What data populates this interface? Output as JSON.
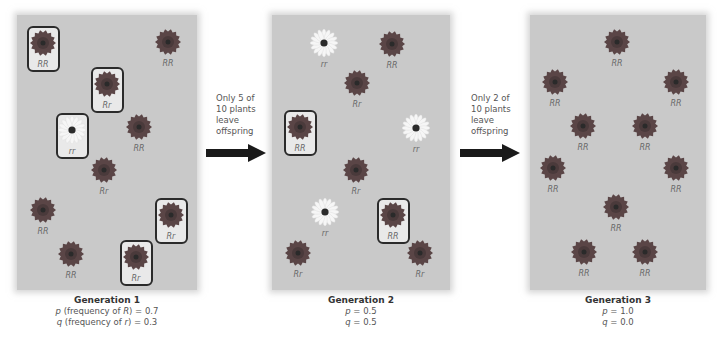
{
  "colors": {
    "panel_bg": "#c9c9c9",
    "dark_flower": "#5a4546",
    "white_flower": "#f6f6f6",
    "flower_center": "#2a2a2a",
    "box_border": "#2b2b2b",
    "arrow": "#1a1a1a"
  },
  "panels": [
    {
      "id": "generation-1",
      "left": 17,
      "width": 180,
      "caption": {
        "title": "Generation 1",
        "p_label": "p",
        "p_text": " (frequency of ",
        "p_allele": "R",
        "p_value": ") = 0.7",
        "q_label": "q",
        "q_text": " (frequency of ",
        "q_allele": "r",
        "q_value": ") = 0.3"
      },
      "plants": [
        {
          "x": 43,
          "y": 43,
          "genotype": "RR",
          "color": "dark",
          "boxed": true
        },
        {
          "x": 168,
          "y": 42,
          "genotype": "RR",
          "color": "dark",
          "boxed": false
        },
        {
          "x": 107,
          "y": 84,
          "genotype": "Rr",
          "color": "dark",
          "boxed": true
        },
        {
          "x": 72,
          "y": 130,
          "genotype": "rr",
          "color": "white",
          "boxed": true
        },
        {
          "x": 139,
          "y": 127,
          "genotype": "RR",
          "color": "dark",
          "boxed": false
        },
        {
          "x": 104,
          "y": 170,
          "genotype": "Rr",
          "color": "dark",
          "boxed": false
        },
        {
          "x": 43,
          "y": 210,
          "genotype": "RR",
          "color": "dark",
          "boxed": false
        },
        {
          "x": 171,
          "y": 215,
          "genotype": "Rr",
          "color": "dark",
          "boxed": true
        },
        {
          "x": 71,
          "y": 254,
          "genotype": "RR",
          "color": "dark",
          "boxed": false
        },
        {
          "x": 136,
          "y": 257,
          "genotype": "Rr",
          "color": "dark",
          "boxed": true
        }
      ]
    },
    {
      "id": "generation-2",
      "left": 272,
      "width": 178,
      "caption": {
        "title": "Generation 2",
        "p_label": "p",
        "p_value": " = 0.5",
        "q_label": "q",
        "q_value": " = 0.5"
      },
      "plants": [
        {
          "x": 324,
          "y": 43,
          "genotype": "rr",
          "color": "white",
          "boxed": false
        },
        {
          "x": 392,
          "y": 44,
          "genotype": "RR",
          "color": "dark",
          "boxed": false
        },
        {
          "x": 357,
          "y": 83,
          "genotype": "Rr",
          "color": "dark",
          "boxed": false
        },
        {
          "x": 300,
          "y": 127,
          "genotype": "RR",
          "color": "dark",
          "boxed": true
        },
        {
          "x": 416,
          "y": 128,
          "genotype": "rr",
          "color": "white",
          "boxed": false
        },
        {
          "x": 356,
          "y": 170,
          "genotype": "Rr",
          "color": "dark",
          "boxed": false
        },
        {
          "x": 325,
          "y": 212,
          "genotype": "rr",
          "color": "white",
          "boxed": false
        },
        {
          "x": 393,
          "y": 215,
          "genotype": "RR",
          "color": "dark",
          "boxed": true
        },
        {
          "x": 298,
          "y": 253,
          "genotype": "Rr",
          "color": "dark",
          "boxed": false
        },
        {
          "x": 420,
          "y": 253,
          "genotype": "Rr",
          "color": "dark",
          "boxed": false
        }
      ]
    },
    {
      "id": "generation-3",
      "left": 530,
      "width": 176,
      "caption": {
        "title": "Generation 3",
        "p_label": "p",
        "p_value": " = 1.0",
        "q_label": "q",
        "q_value": " = 0.0"
      },
      "plants": [
        {
          "x": 617,
          "y": 42,
          "genotype": "RR",
          "color": "dark",
          "boxed": false
        },
        {
          "x": 555,
          "y": 82,
          "genotype": "RR",
          "color": "dark",
          "boxed": false
        },
        {
          "x": 676,
          "y": 82,
          "genotype": "RR",
          "color": "dark",
          "boxed": false
        },
        {
          "x": 583,
          "y": 126,
          "genotype": "RR",
          "color": "dark",
          "boxed": false
        },
        {
          "x": 645,
          "y": 126,
          "genotype": "RR",
          "color": "dark",
          "boxed": false
        },
        {
          "x": 553,
          "y": 168,
          "genotype": "RR",
          "color": "dark",
          "boxed": false
        },
        {
          "x": 676,
          "y": 168,
          "genotype": "RR",
          "color": "dark",
          "boxed": false
        },
        {
          "x": 616,
          "y": 207,
          "genotype": "RR",
          "color": "dark",
          "boxed": false
        },
        {
          "x": 584,
          "y": 252,
          "genotype": "RR",
          "color": "dark",
          "boxed": false
        },
        {
          "x": 645,
          "y": 252,
          "genotype": "RR",
          "color": "dark",
          "boxed": false
        }
      ]
    }
  ],
  "transitions": [
    {
      "lines": [
        "Only 5 of",
        "10 plants",
        "leave",
        "offspring"
      ],
      "x": 206,
      "y": 98
    },
    {
      "lines": [
        "Only 2 of",
        "10 plants",
        "leave",
        "offspring"
      ],
      "x": 460,
      "y": 98
    }
  ]
}
